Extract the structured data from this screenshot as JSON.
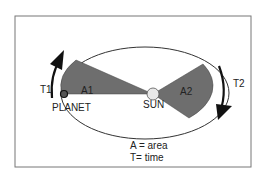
{
  "diagram": {
    "labels": {
      "planet": "PLANET",
      "sun": "SUN",
      "area1": "A1",
      "area2": "A2",
      "time1": "T1",
      "time2": "T2"
    },
    "legend": {
      "line1": "A = area",
      "line2": "T= time"
    },
    "colors": {
      "sector_fill": "#6e6e6e",
      "orbit_stroke": "#333333",
      "sun_fill": "#e8e8e8",
      "arrow": "#111111",
      "frame": "#666666"
    }
  }
}
